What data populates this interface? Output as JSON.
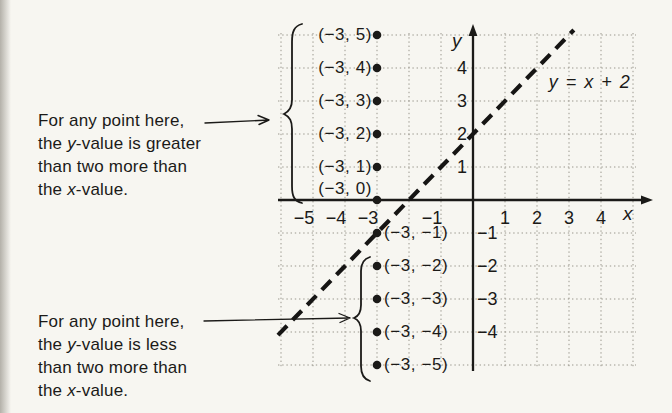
{
  "figure": {
    "background": "#f7f6f1",
    "ink_color": "#1b1a18",
    "grid_color": "#9a978d"
  },
  "annotations": {
    "upper": {
      "lines": [
        [
          {
            "t": "For any point here,"
          }
        ],
        [
          {
            "t": "the "
          },
          {
            "t": "y",
            "i": true
          },
          {
            "t": "-value is greater"
          }
        ],
        [
          {
            "t": "than two more than"
          }
        ],
        [
          {
            "t": "the "
          },
          {
            "t": "x",
            "i": true
          },
          {
            "t": "-value."
          }
        ]
      ]
    },
    "lower": {
      "lines": [
        [
          {
            "t": "For any point here,"
          }
        ],
        [
          {
            "t": "the "
          },
          {
            "t": "y",
            "i": true
          },
          {
            "t": "-value is less"
          }
        ],
        [
          {
            "t": "than two more than"
          }
        ],
        [
          {
            "t": "the "
          },
          {
            "t": "x",
            "i": true
          },
          {
            "t": "-value."
          }
        ]
      ]
    }
  },
  "chart_data": {
    "type": "scatter",
    "title": "",
    "equation_label": "y = x + 2",
    "xlabel": "x",
    "ylabel": "y",
    "xlim": [
      -6,
      5
    ],
    "ylim": [
      -5,
      5
    ],
    "grid": true,
    "line": {
      "slope": 1,
      "intercept": 2,
      "style": "dashed",
      "color": "#161514"
    },
    "points": [
      {
        "x": -3,
        "y": 5,
        "label": "(−3, 5)"
      },
      {
        "x": -3,
        "y": 4,
        "label": "(−3, 4)"
      },
      {
        "x": -3,
        "y": 3,
        "label": "(−3, 3)"
      },
      {
        "x": -3,
        "y": 2,
        "label": "(−3, 2)"
      },
      {
        "x": -3,
        "y": 1,
        "label": "(−3, 1)"
      },
      {
        "x": -3,
        "y": 0,
        "label": "(−3, 0)"
      },
      {
        "x": -3,
        "y": -1,
        "label": "(−3, −1)"
      },
      {
        "x": -3,
        "y": -2,
        "label": "(−3, −2)"
      },
      {
        "x": -3,
        "y": -3,
        "label": "(−3, −3)"
      },
      {
        "x": -3,
        "y": -4,
        "label": "(−3, −4)"
      },
      {
        "x": -3,
        "y": -5,
        "label": "(−3, −5)"
      }
    ],
    "x_tick_labels": [
      {
        "value": -5,
        "label": "−5"
      },
      {
        "value": -4,
        "label": "−4"
      },
      {
        "value": -3,
        "label": "−3"
      },
      {
        "value": -1,
        "label": "−1"
      },
      {
        "value": 1,
        "label": "1"
      },
      {
        "value": 2,
        "label": "2"
      },
      {
        "value": 3,
        "label": "3"
      },
      {
        "value": 4,
        "label": "4"
      }
    ],
    "y_tick_labels": [
      {
        "value": 4,
        "label": "4"
      },
      {
        "value": 3,
        "label": "3"
      },
      {
        "value": 2,
        "label": "2"
      },
      {
        "value": 1,
        "label": "1"
      },
      {
        "value": -1,
        "label": "−1"
      },
      {
        "value": -2,
        "label": "−2"
      },
      {
        "value": -3,
        "label": "−3"
      },
      {
        "value": -4,
        "label": "−4"
      }
    ]
  }
}
